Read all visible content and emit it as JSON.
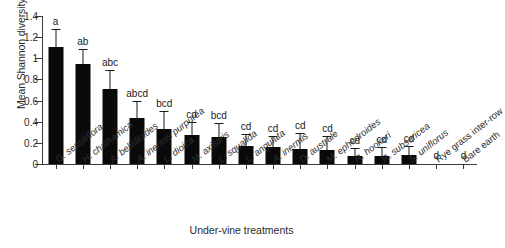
{
  "chart_data": {
    "type": "bar",
    "title": "",
    "xlabel": "Under-vine treatments",
    "ylabel": "Mean Shannon diversity index val.",
    "ylim": [
      0,
      1.4
    ],
    "yticks": [
      "0",
      "0.2",
      "0.4",
      "0.6",
      "0.8",
      "1",
      "1.2",
      "1.4"
    ],
    "ytick_values": [
      0,
      0.2,
      0.4,
      0.6,
      0.8,
      1.0,
      1.2,
      1.4
    ],
    "grid": false,
    "legend": "none",
    "bar_color": "#0a0a0a",
    "axis_color": "#3a3a3a",
    "categories": [
      "G. sessiliflora",
      "H. chathamica",
      "A. bellidioides",
      "A. inermis purpurea",
      "L. dioica",
      "M. axillaris",
      "L. squalida",
      "L. angulata",
      "A. inermis",
      "D. australe",
      "M. ephedroides",
      "R. hookeri",
      "R. subsericea",
      "S. uniflorus",
      "Rye grass inter-row",
      "Bare earth"
    ],
    "category_styles": [
      "italic",
      "italic",
      "italic",
      "italic",
      "italic",
      "italic",
      "italic",
      "italic",
      "italic",
      "italic",
      "italic",
      "italic",
      "italic",
      "italic",
      "plain",
      "plain"
    ],
    "values": [
      1.11,
      0.95,
      0.71,
      0.44,
      0.33,
      0.27,
      0.26,
      0.17,
      0.16,
      0.14,
      0.13,
      0.08,
      0.08,
      0.09,
      0.0,
      0.0
    ],
    "errors": [
      0.16,
      0.13,
      0.17,
      0.15,
      0.16,
      0.12,
      0.12,
      0.1,
      0.1,
      0.14,
      0.13,
      0.06,
      0.07,
      0.07,
      0.0,
      0.0
    ],
    "significance_letters": [
      "a",
      "ab",
      "abc",
      "abcd",
      "bcd",
      "cd",
      "bcd",
      "cd",
      "cd",
      "cd",
      "cd",
      "cd",
      "cd",
      "cd",
      "d",
      "d"
    ],
    "error_bar_style": "upper-only",
    "n_categories": 16
  }
}
